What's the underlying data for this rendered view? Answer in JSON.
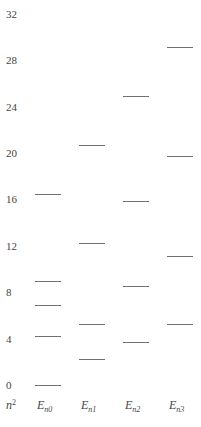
{
  "diagram": {
    "type": "energy-level-diagram",
    "y_axis_label": {
      "base": "n",
      "sup": "2"
    },
    "y_ticks": [
      0,
      4,
      8,
      12,
      16,
      20,
      24,
      28,
      32
    ],
    "columns": [
      {
        "label": "E",
        "sub": "n0",
        "levels": [
          0,
          4.2,
          6.9,
          9.0,
          16.5
        ]
      },
      {
        "label": "E",
        "sub": "n1",
        "levels": [
          2.2,
          5.3,
          12.2,
          20.7
        ]
      },
      {
        "label": "E",
        "sub": "n2",
        "levels": [
          3.7,
          8.5,
          15.9,
          24.9
        ]
      },
      {
        "label": "E",
        "sub": "n3",
        "levels": [
          5.3,
          11.1,
          19.7,
          29.1
        ]
      }
    ],
    "line_color": "#6e6e6e"
  }
}
